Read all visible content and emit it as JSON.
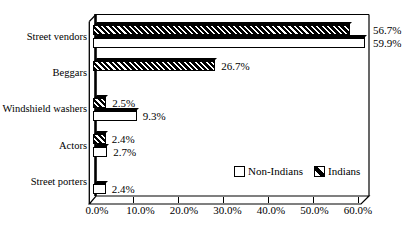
{
  "chart_data": {
    "type": "bar",
    "style": "3d-horizontal-bar",
    "orientation": "horizontal",
    "title": "",
    "categories": [
      "Street vendors",
      "Beggars",
      "Windshield washers",
      "Actors",
      "Street porters"
    ],
    "series": [
      {
        "name": "Non-Indians",
        "pattern": "solid-white",
        "values": [
          59.9,
          null,
          9.3,
          2.7,
          2.4
        ],
        "data_labels": [
          "59.9%",
          null,
          "9.3%",
          "2.7%",
          "2.4%"
        ]
      },
      {
        "name": "Indians",
        "pattern": "diagonal-hatch",
        "values": [
          56.7,
          26.7,
          2.5,
          2.4,
          null
        ],
        "data_labels": [
          "56.7%",
          "26.7%",
          "2.5%",
          "2.4%",
          null
        ]
      }
    ],
    "x_axis": {
      "ticks": [
        "0.0%",
        "10.0%",
        "20.0%",
        "30.0%",
        "40.0%",
        "50.0%",
        "60.0%"
      ],
      "min": 0,
      "max": 60,
      "unit": "%"
    },
    "legend": {
      "position": "inside-bottom-right",
      "entries": [
        "Non-Indians",
        "Indians"
      ]
    },
    "colors": {
      "background": "#ffffff",
      "bar_fill": "#ffffff",
      "hatch": "#000000",
      "outline": "#000000"
    },
    "grid": false
  }
}
